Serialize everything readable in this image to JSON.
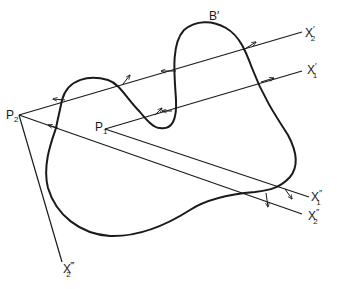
{
  "diagram": {
    "curve_label": "B′",
    "points": [
      {
        "id": "P2",
        "base": "P",
        "sub": "2"
      },
      {
        "id": "P1",
        "base": "P",
        "sub": "1"
      }
    ],
    "rays": [
      {
        "id": "X2prime",
        "base": "X",
        "sub": "2",
        "prime": "′"
      },
      {
        "id": "X1prime",
        "base": "X",
        "sub": "1",
        "prime": "′"
      },
      {
        "id": "X1dprime",
        "base": "X",
        "sub": "1",
        "prime": "″"
      },
      {
        "id": "X2dprime",
        "base": "X",
        "sub": "2",
        "prime": "″"
      },
      {
        "id": "X2tprime",
        "base": "X",
        "sub": "2",
        "prime": "‴"
      }
    ],
    "colors": {
      "stroke": "#1a1a1a",
      "background": "#ffffff"
    }
  }
}
